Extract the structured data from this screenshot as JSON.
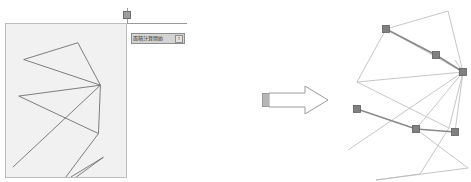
{
  "window": {
    "background_color": "#ffffff"
  },
  "left_panel": {
    "canvas": {
      "name": "polygon-canvas",
      "background_color": "#f1f1f1",
      "border_color": "#bdbdbd",
      "stroke_color": "#6f6f6f",
      "polygon_points": "73,19 18,36 96,62 94,111 13,73 88,102 7,145 48,172 99,135 66,155",
      "polyline_segments": [
        {
          "name": "seg-1",
          "points": "73,19 18,36"
        },
        {
          "name": "seg-2",
          "points": "18,36 96,62"
        },
        {
          "name": "seg-3",
          "points": "96,62 73,19"
        },
        {
          "name": "seg-4",
          "points": "96,62 94,111"
        },
        {
          "name": "seg-5",
          "points": "94,111 13,73"
        },
        {
          "name": "seg-6",
          "points": "13,73 96,62"
        },
        {
          "name": "seg-7",
          "points": "96,62 7,145"
        },
        {
          "name": "seg-8",
          "points": "94,111 48,172"
        },
        {
          "name": "seg-9",
          "points": "48,172 99,135"
        },
        {
          "name": "seg-10",
          "points": "99,135 66,155"
        }
      ]
    },
    "drag_handle": {
      "name": "resize-handle",
      "fill": "#9e9e9e",
      "border": "#6d6d6d"
    },
    "guides": {
      "color": "#9a9a9a"
    },
    "combo": {
      "value": "面積計算開始",
      "placeholder": "",
      "button_glyph": "↕",
      "background": "#d4d4d4",
      "border": "#8e8e8e"
    }
  },
  "arrow": {
    "name": "transform-arrow",
    "direction": "right",
    "outline_color": "#9a9a9a",
    "fill_color": "#ffffff",
    "block_color": "#b5b5b5"
  },
  "right_panel": {
    "diagram": {
      "name": "result-diagram",
      "faint_stroke_color": "#b8b8b8",
      "highlight_stroke_color": "#8a8a8a",
      "vertex_marker_color": "#808080",
      "vertex_marker_border": "#5e5e5e",
      "faint_segments": [
        {
          "name": "faint-1",
          "points": "56,21 118,3"
        },
        {
          "name": "faint-2",
          "points": "118,3 133,64"
        },
        {
          "name": "faint-3",
          "points": "133,64 125,52"
        },
        {
          "name": "faint-4",
          "points": "56,21 27,74"
        },
        {
          "name": "faint-5",
          "points": "27,74 119,120"
        },
        {
          "name": "faint-6",
          "points": "119,120 133,64"
        },
        {
          "name": "faint-7",
          "points": "119,120 90,166"
        },
        {
          "name": "faint-8",
          "points": "90,166 46,172"
        },
        {
          "name": "faint-9",
          "points": "46,172 138,160"
        },
        {
          "name": "faint-10",
          "points": "133,64 18,142"
        },
        {
          "name": "faint-11",
          "points": "133,64 86,121"
        },
        {
          "name": "faint-12",
          "points": "27,74 133,64"
        },
        {
          "name": "faint-13",
          "points": "86,121 138,160"
        },
        {
          "name": "faint-14",
          "points": "56,21 133,64"
        },
        {
          "name": "faint-15",
          "points": "133,64 125,124"
        }
      ],
      "highlight_segments": [
        {
          "name": "hl-1",
          "points": "56,21 106,47"
        },
        {
          "name": "hl-2",
          "points": "106,47 133,64"
        },
        {
          "name": "hl-3",
          "points": "27,101 86,121"
        },
        {
          "name": "hl-4",
          "points": "86,121 125,124"
        }
      ],
      "vertices": [
        {
          "name": "vertex-1",
          "x": 56,
          "y": 21
        },
        {
          "name": "vertex-2",
          "x": 106,
          "y": 47
        },
        {
          "name": "vertex-3",
          "x": 133,
          "y": 64
        },
        {
          "name": "vertex-4",
          "x": 27,
          "y": 101
        },
        {
          "name": "vertex-5",
          "x": 86,
          "y": 121
        },
        {
          "name": "vertex-6",
          "x": 125,
          "y": 124
        }
      ]
    }
  }
}
